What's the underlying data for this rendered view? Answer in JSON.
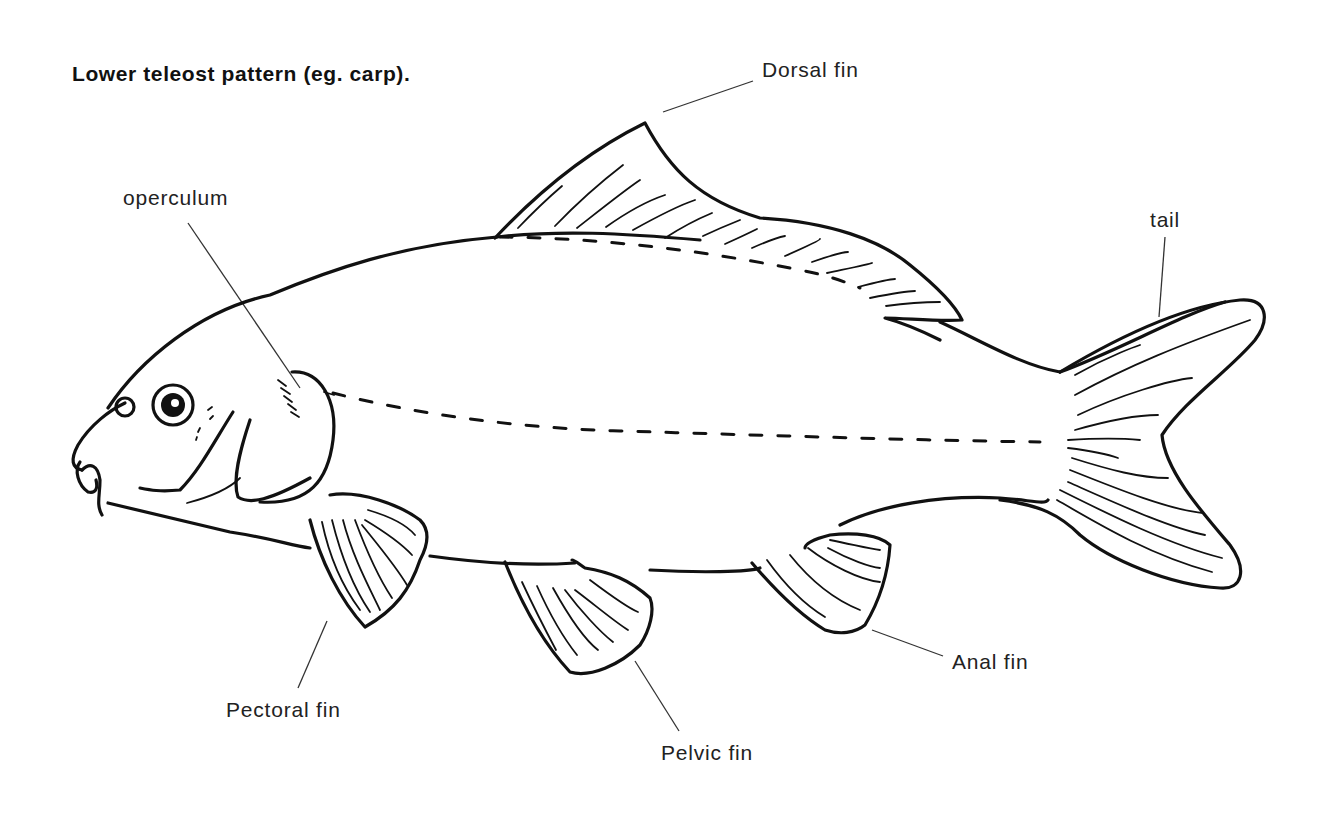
{
  "title": "Lower teleost pattern (eg. carp).",
  "labels": {
    "dorsal_fin": "Dorsal fin",
    "operculum": "operculum",
    "tail": "tail",
    "pectoral_fin": "Pectoral fin",
    "pelvic_fin": "Pelvic fin",
    "anal_fin": "Anal fin"
  },
  "colors": {
    "line": "#111111",
    "background": "#ffffff",
    "text": "#222222"
  }
}
